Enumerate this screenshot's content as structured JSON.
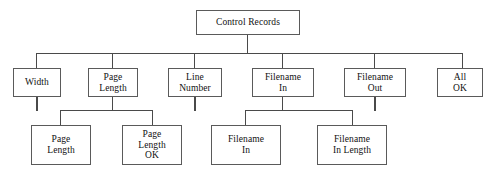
{
  "diagram": {
    "type": "structure-chart",
    "title": "Control Records",
    "levels": 3,
    "nodes": {
      "root": {
        "id": "control-records",
        "label": "Control Records",
        "lines": [
          "Control Records"
        ],
        "level": 1,
        "x": 196,
        "y": 10,
        "w": 104,
        "h": 25
      },
      "level2": [
        {
          "id": "width",
          "label": "Width",
          "lines": [
            "Width"
          ],
          "x": 13,
          "y": 68,
          "w": 48,
          "h": 29,
          "has_stub": true,
          "children": []
        },
        {
          "id": "page-length",
          "label": "Page Length",
          "lines": [
            "Page",
            "Length"
          ],
          "x": 88,
          "y": 68,
          "w": 50,
          "h": 29,
          "has_stub": false,
          "children": [
            "page-length-child",
            "page-length-ok"
          ]
        },
        {
          "id": "line-number",
          "label": "Line Number",
          "lines": [
            "Line",
            "Number"
          ],
          "x": 168,
          "y": 68,
          "w": 54,
          "h": 29,
          "has_stub": true,
          "children": []
        },
        {
          "id": "filename-in",
          "label": "Filename In",
          "lines": [
            "Filename",
            "In"
          ],
          "x": 252,
          "y": 68,
          "w": 62,
          "h": 29,
          "has_stub": false,
          "children": [
            "filename-in-child",
            "filename-in-length"
          ]
        },
        {
          "id": "filename-out",
          "label": "Filename Out",
          "lines": [
            "Filename",
            "Out"
          ],
          "x": 344,
          "y": 68,
          "w": 62,
          "h": 29,
          "has_stub": true,
          "children": []
        },
        {
          "id": "all-ok",
          "label": "All OK",
          "lines": [
            "All",
            "OK"
          ],
          "x": 437,
          "y": 68,
          "w": 46,
          "h": 29,
          "has_stub": false,
          "children": []
        }
      ],
      "level3": [
        {
          "id": "page-length-child",
          "label": "Page Length",
          "lines": [
            "Page",
            "Length"
          ],
          "parent": "page-length",
          "x": 31,
          "y": 125,
          "w": 60,
          "h": 40
        },
        {
          "id": "page-length-ok",
          "label": "Page Length OK",
          "lines": [
            "Page",
            "Length",
            "OK"
          ],
          "parent": "page-length",
          "x": 122,
          "y": 125,
          "w": 60,
          "h": 40
        },
        {
          "id": "filename-in-child",
          "label": "Filename In",
          "lines": [
            "Filename",
            "In"
          ],
          "parent": "filename-in",
          "x": 211,
          "y": 125,
          "w": 70,
          "h": 40
        },
        {
          "id": "filename-in-length",
          "label": "Filename In Length",
          "lines": [
            "Filename",
            "In Length"
          ],
          "parent": "filename-in",
          "x": 317,
          "y": 125,
          "w": 70,
          "h": 40
        }
      ]
    },
    "connectors": {
      "root_drop": {
        "x": 247,
        "y": 35,
        "h": 18
      },
      "main_bus": {
        "x": 36,
        "y": 53,
        "w": 426
      },
      "level2_drops": [
        {
          "x": 36,
          "y": 53,
          "h": 15
        },
        {
          "x": 112,
          "y": 53,
          "h": 15
        },
        {
          "x": 194,
          "y": 53,
          "h": 15
        },
        {
          "x": 282,
          "y": 53,
          "h": 15
        },
        {
          "x": 374,
          "y": 53,
          "h": 15
        },
        {
          "x": 462,
          "y": 53,
          "h": 15
        }
      ],
      "stubs": [
        {
          "x": 36,
          "y": 97,
          "h": 14
        },
        {
          "x": 194,
          "y": 97,
          "h": 14
        },
        {
          "x": 374,
          "y": 97,
          "h": 14
        }
      ],
      "sub_buses": [
        {
          "parent": "page-length",
          "drop_x": 112,
          "drop_y": 97,
          "drop_h": 13,
          "bus_x": 60,
          "bus_y": 110,
          "bus_w": 92,
          "child_drops": [
            {
              "x": 60,
              "h": 15
            },
            {
              "x": 152,
              "h": 15
            }
          ]
        },
        {
          "parent": "filename-in",
          "drop_x": 282,
          "drop_y": 97,
          "drop_h": 13,
          "bus_x": 245,
          "bus_y": 110,
          "bus_w": 107,
          "child_drops": [
            {
              "x": 245,
              "h": 15
            },
            {
              "x": 352,
              "h": 15
            }
          ]
        }
      ]
    },
    "colors": {
      "background": "#ffffff",
      "box_border": "#5a5a5a",
      "line": "#4a4a4a",
      "text": "#111111"
    }
  }
}
